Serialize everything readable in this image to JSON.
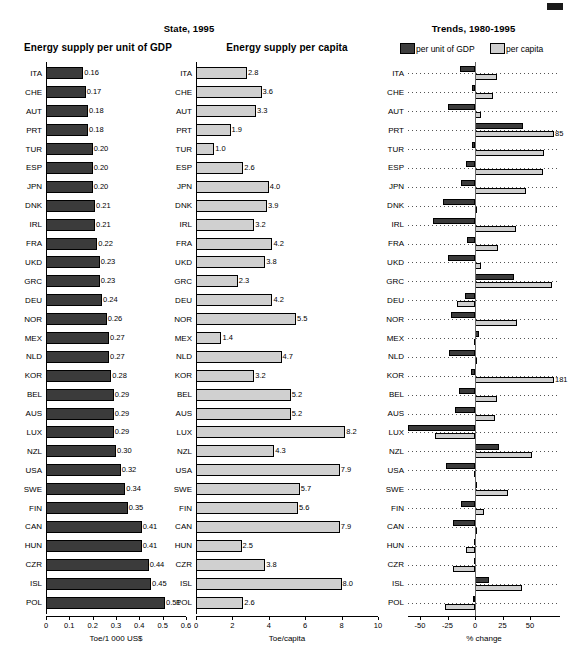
{
  "suptitles": {
    "state": "State, 1995",
    "trends": "Trends, 1980-1995"
  },
  "panels": {
    "gdp": {
      "title": "Energy supply per unit of GDP",
      "axis_title": "Toe/1 000 US$",
      "ticks": [
        "0",
        "0.1",
        "0.2",
        "0.3",
        "0.4",
        "0.5",
        "0.6"
      ]
    },
    "capita": {
      "title": "Energy supply per capita",
      "axis_title": "Toe/capita",
      "ticks": [
        "0",
        "2",
        "4",
        "6",
        "8",
        "10"
      ]
    },
    "trends": {
      "axis_title": "% change",
      "ticks": [
        "-50",
        "-25",
        "0",
        "25",
        "50"
      ]
    }
  },
  "legend": {
    "gdp_label": "per unit of GDP",
    "capita_label": "per capita",
    "gdp_color": "#3e3e3e",
    "capita_color": "#cfcfcf"
  },
  "countries": [
    "ITA",
    "CHE",
    "AUT",
    "PRT",
    "TUR",
    "ESP",
    "JPN",
    "DNK",
    "IRL",
    "FRA",
    "UKD",
    "GRC",
    "DEU",
    "NOR",
    "MEX",
    "NLD",
    "KOR",
    "BEL",
    "AUS",
    "LUX",
    "NZL",
    "USA",
    "SWE",
    "FIN",
    "CAN",
    "HUN",
    "CZR",
    "ISL",
    "POL"
  ],
  "chart_data": [
    {
      "type": "bar",
      "title": "Energy supply per unit of GDP",
      "orientation": "horizontal",
      "xlabel": "Toe/1 000 US$",
      "ylabel": "",
      "xlim": [
        0,
        0.6
      ],
      "grid": false,
      "categories": [
        "ITA",
        "CHE",
        "AUT",
        "PRT",
        "TUR",
        "ESP",
        "JPN",
        "DNK",
        "IRL",
        "FRA",
        "UKD",
        "GRC",
        "DEU",
        "NOR",
        "MEX",
        "NLD",
        "KOR",
        "BEL",
        "AUS",
        "LUX",
        "NZL",
        "USA",
        "SWE",
        "FIN",
        "CAN",
        "HUN",
        "CZR",
        "ISL",
        "POL"
      ],
      "values": [
        0.16,
        0.17,
        0.18,
        0.18,
        0.2,
        0.2,
        0.2,
        0.21,
        0.21,
        0.22,
        0.23,
        0.23,
        0.24,
        0.26,
        0.27,
        0.27,
        0.28,
        0.29,
        0.29,
        0.29,
        0.3,
        0.32,
        0.34,
        0.35,
        0.41,
        0.41,
        0.44,
        0.45,
        0.51
      ],
      "labels": [
        "0.16",
        "0.17",
        "0.18",
        "0.18",
        "0.20",
        "0.20",
        "0.20",
        "0.21",
        "0.21",
        "0.22",
        "0.23",
        "0.23",
        "0.24",
        "0.26",
        "0.27",
        "0.27",
        "0.28",
        "0.29",
        "0.29",
        "0.29",
        "0.30",
        "0.32",
        "0.34",
        "0.35",
        "0.41",
        "0.41",
        "0.44",
        "0.45",
        "0.51"
      ],
      "color": "#3b3b3b"
    },
    {
      "type": "bar",
      "title": "Energy supply per capita",
      "orientation": "horizontal",
      "xlabel": "Toe/capita",
      "ylabel": "",
      "xlim": [
        0,
        10
      ],
      "grid": false,
      "categories": [
        "ITA",
        "CHE",
        "AUT",
        "PRT",
        "TUR",
        "ESP",
        "JPN",
        "DNK",
        "IRL",
        "FRA",
        "UKD",
        "GRC",
        "DEU",
        "NOR",
        "MEX",
        "NLD",
        "KOR",
        "BEL",
        "AUS",
        "LUX",
        "NZL",
        "USA",
        "SWE",
        "FIN",
        "CAN",
        "HUN",
        "CZR",
        "ISL",
        "POL"
      ],
      "values": [
        2.8,
        3.6,
        3.3,
        1.9,
        1.0,
        2.6,
        4.0,
        3.9,
        3.2,
        4.2,
        3.8,
        2.3,
        4.2,
        5.5,
        1.4,
        4.7,
        3.2,
        5.2,
        5.2,
        8.2,
        4.3,
        7.9,
        5.7,
        5.6,
        7.9,
        2.5,
        3.8,
        8.0,
        2.6
      ],
      "labels": [
        "2.8",
        "3.6",
        "3.3",
        "1.9",
        "1.0",
        "2.6",
        "4.0",
        "3.9",
        "3.2",
        "4.2",
        "3.8",
        "2.3",
        "4.2",
        "5.5",
        "1.4",
        "4.7",
        "3.2",
        "5.2",
        "5.2",
        "8.2",
        "4.3",
        "7.9",
        "5.7",
        "5.6",
        "7.9",
        "2.5",
        "3.8",
        "8.0",
        "2.6"
      ],
      "color": "#d0d0d0"
    },
    {
      "type": "bar",
      "title": "Trends, 1980-1995",
      "orientation": "horizontal",
      "xlabel": "% change",
      "ylabel": "",
      "xlim": [
        -60,
        60
      ],
      "grid": true,
      "categories": [
        "ITA",
        "CHE",
        "AUT",
        "PRT",
        "TUR",
        "ESP",
        "JPN",
        "DNK",
        "IRL",
        "FRA",
        "UKD",
        "GRC",
        "DEU",
        "NOR",
        "MEX",
        "NLD",
        "KOR",
        "BEL",
        "AUS",
        "LUX",
        "NZL",
        "USA",
        "SWE",
        "FIN",
        "CAN",
        "HUN",
        "CZR",
        "ISL",
        "POL"
      ],
      "series": [
        {
          "name": "per unit of GDP",
          "color": "#3b3b3b",
          "values": [
            -14,
            -3,
            -25,
            44,
            -3,
            -8,
            -13,
            -29,
            -38,
            -7,
            -25,
            35,
            -9,
            -22,
            4,
            -24,
            -4,
            -15,
            -18,
            -62,
            22,
            -26,
            2,
            -13,
            -20,
            -1,
            -1,
            13,
            -2
          ]
        },
        {
          "name": "per capita",
          "color": "#d0d0d0",
          "values": [
            20,
            16,
            5,
            85,
            63,
            62,
            46,
            1,
            37,
            21,
            5,
            70,
            -16,
            38,
            -1,
            2,
            181,
            20,
            18,
            -36,
            52,
            -1,
            30,
            8,
            2,
            -8,
            -20,
            43,
            -27
          ]
        }
      ],
      "annotations": [
        {
          "category": "PRT",
          "series": "per capita",
          "text": "85"
        },
        {
          "category": "KOR",
          "series": "per capita",
          "text": "181"
        }
      ]
    }
  ]
}
